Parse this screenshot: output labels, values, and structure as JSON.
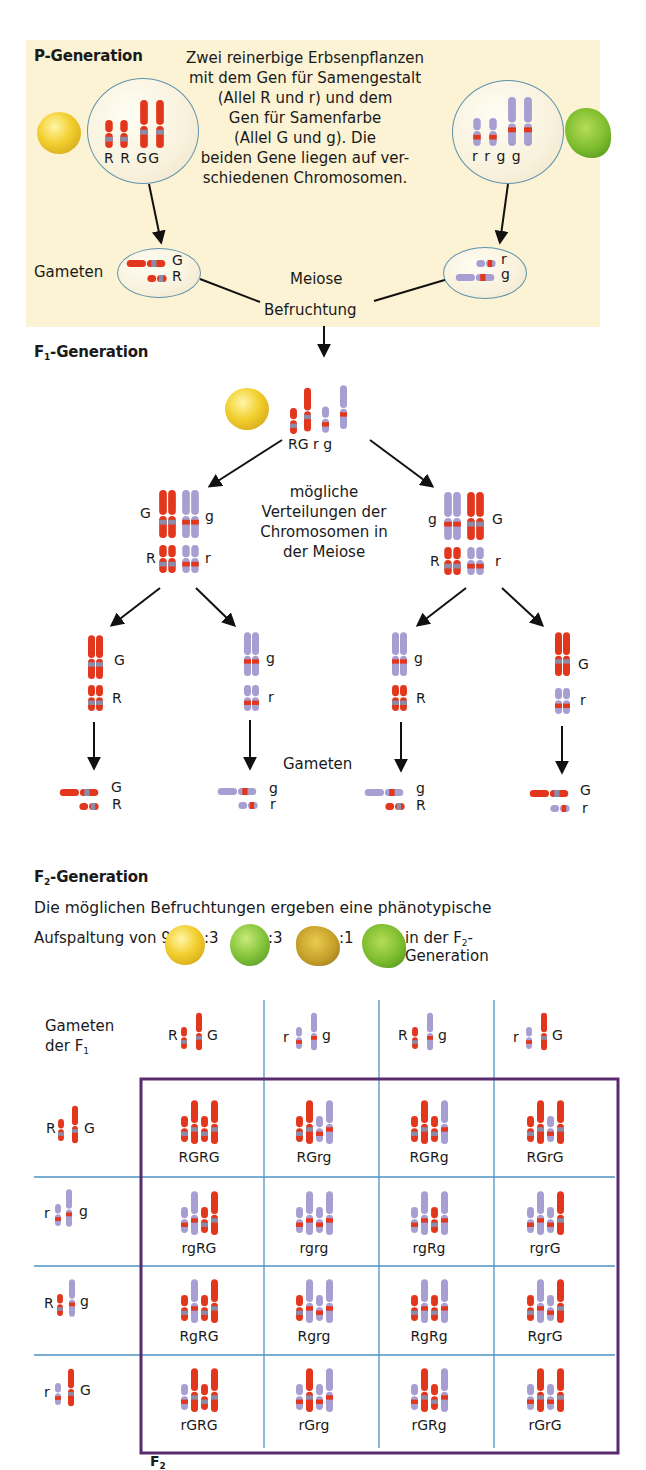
{
  "colors": {
    "panel_bg": "#fbf3d4",
    "cell_border": "#5f93ad",
    "chrom_red": "#e2361d",
    "chrom_purple": "#a79ed1",
    "band_gray": "#8d8ca8",
    "grid_blue": "#4c93c3",
    "punnett_border": "#5a2a6e"
  },
  "p_generation": {
    "title": "P-Generation",
    "description_lines": [
      "Zwei reinerbige Erbsenpflanzen",
      "mit dem Gen für Samengestalt",
      "(Allel R und r) und dem",
      "Gen für Samenfarbe",
      "(Allel G und g). Die",
      "beiden Gene liegen auf ver-",
      "schiedenen Chromosomen."
    ],
    "parent_left": {
      "alleles": [
        "R",
        "R",
        "G",
        "G"
      ],
      "label": "R R GG",
      "pea": "yellow-round-pea"
    },
    "parent_right": {
      "alleles": [
        "r",
        "r",
        "g",
        "g"
      ],
      "label": "r r g g",
      "pea": "green-wrinkled-pea"
    },
    "gametes_label": "Gameten",
    "gamete_left": {
      "top": "G",
      "bottom": "R"
    },
    "gamete_right": {
      "top": "r",
      "bottom": "g"
    },
    "meiose_label": "Meiose",
    "befruchtung_label": "Befruchtung"
  },
  "f1_generation": {
    "title_prefix": "F",
    "title_sub": "1",
    "title_suffix": "-Generation",
    "cell_label": "RG r g",
    "meiosis_text_lines": [
      "mögliche",
      "Verteilungen der",
      "Chromosomen in",
      "der Meiose"
    ],
    "metaphase_left": {
      "tl": "G",
      "tr": "g",
      "bl": "R",
      "br": "r"
    },
    "metaphase_right": {
      "tl": "g",
      "tr": "G",
      "bl": "R",
      "br": "r"
    },
    "daughter_cells": [
      {
        "top": "G",
        "bottom": "R"
      },
      {
        "top": "g",
        "bottom": "r"
      },
      {
        "top": "g",
        "bottom": "R"
      },
      {
        "top": "G",
        "bottom": "r"
      }
    ],
    "gametes_label": "Gameten",
    "gametes": [
      {
        "top": "G",
        "bottom": "R"
      },
      {
        "top": "g",
        "bottom": "r"
      },
      {
        "top": "g",
        "bottom": "R"
      },
      {
        "top": "G",
        "bottom": "r"
      }
    ]
  },
  "f2_generation": {
    "title_prefix": "F",
    "title_sub": "2",
    "title_suffix": "-Generation",
    "line1": "Die möglichen Befruchtungen ergeben eine phänotypische",
    "line2_prefix": "Aufspaltung von 9",
    "ratios": [
      ":3",
      ":3",
      ":1"
    ],
    "suffix_a": "in der F",
    "suffix_sub": "2",
    "suffix_b": "-",
    "suffix_line2": "Generation",
    "phenotypes": [
      "yellow-round-pea",
      "green-round-pea",
      "yellow-wrinkled-pea",
      "green-wrinkled-pea"
    ],
    "gametes_header_line1": "Gameten",
    "gametes_header_line2_prefix": "der F",
    "gametes_header_sub": "1",
    "gamete_types": [
      {
        "left": "R",
        "right": "G"
      },
      {
        "left": "r",
        "right": "g"
      },
      {
        "left": "R",
        "right": "g"
      },
      {
        "left": "r",
        "right": "G"
      }
    ],
    "genotypes": [
      [
        "RGRG",
        "RGrg",
        "RGRg",
        "RGrG"
      ],
      [
        "rgRG",
        "rgrg",
        "rgRg",
        "rgrG"
      ],
      [
        "RgRG",
        "Rgrg",
        "RgRg",
        "RgrG"
      ],
      [
        "rGRG",
        "rGrg",
        "rGRg",
        "rGrG"
      ]
    ],
    "footer_prefix": "F",
    "footer_sub": "2"
  }
}
